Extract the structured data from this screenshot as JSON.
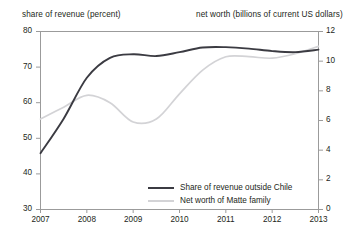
{
  "chart_data": {
    "type": "line",
    "title": "",
    "left_axis": {
      "label": "share of revenue (percent)",
      "ticks": [
        30,
        40,
        50,
        60,
        70,
        80
      ],
      "ylim": [
        30,
        80
      ]
    },
    "right_axis": {
      "label": "net worth (billions of current US dollars)",
      "ticks": [
        0,
        2,
        4,
        6,
        8,
        10,
        12
      ],
      "ylim": [
        0,
        12
      ]
    },
    "xlabel": "",
    "x_ticks": [
      "2007",
      "2008",
      "2009",
      "2010",
      "2011",
      "2012",
      "2013"
    ],
    "xlim": [
      2007,
      2013
    ],
    "grid": false,
    "legend_position": "bottom-center",
    "series": [
      {
        "name": "Share of revenue outside Chile",
        "axis": "left",
        "color": "#3b3b42",
        "x": [
          2007,
          2007.5,
          2008,
          2008.5,
          2009,
          2009.5,
          2010,
          2010.5,
          2011,
          2011.5,
          2012,
          2012.5,
          2013
        ],
        "values": [
          45.8,
          55.5,
          67.0,
          72.6,
          73.6,
          73.1,
          74.2,
          75.5,
          75.6,
          75.2,
          74.5,
          74.2,
          74.9
        ]
      },
      {
        "name": "Net worth of Matte family",
        "axis": "right",
        "color": "#d3d3d6",
        "x": [
          2007,
          2007.5,
          2008,
          2008.5,
          2009,
          2009.5,
          2010,
          2010.5,
          2011,
          2011.5,
          2012,
          2012.5,
          2013
        ],
        "values": [
          6.1,
          6.9,
          7.7,
          7.2,
          5.9,
          6.1,
          7.8,
          9.4,
          10.3,
          10.3,
          10.2,
          10.5,
          11.0
        ]
      }
    ]
  },
  "axes": {
    "left_caption": "share of revenue (percent)",
    "right_caption": "net worth (billions of current US dollars)"
  },
  "legend": {
    "items": [
      {
        "label": "Share of revenue outside Chile",
        "style": "dark"
      },
      {
        "label": "Net worth of Matte family",
        "style": "light"
      }
    ]
  }
}
